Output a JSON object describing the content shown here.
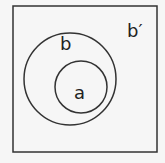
{
  "diagram": {
    "type": "venn",
    "universe_label": "b′",
    "outer_set_label": "b",
    "inner_set_label": "a",
    "relationship": "a is a subset of b; b' is the complement of b"
  },
  "colors": {
    "stroke": "#222222",
    "background": "#f6f6f6"
  }
}
